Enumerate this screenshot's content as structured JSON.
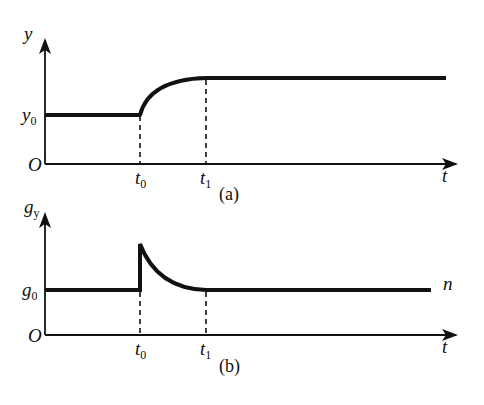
{
  "colors": {
    "background": "#ffffff",
    "ink": "#111111"
  },
  "panels": [
    {
      "id": "a",
      "caption": "(a)",
      "y_axis_label": "y",
      "x_axis_label": "t",
      "origin_label": "O",
      "level_label": "y",
      "level_sub": "0",
      "tick_t0": "t",
      "tick_t0_sub": "0",
      "tick_t1": "t",
      "tick_t1_sub": "1",
      "curve_description": "constant at y0 until t0, rises along a concave saturating curve, reaches higher plateau at t1 and stays constant"
    },
    {
      "id": "b",
      "caption": "(b)",
      "y_axis_label": "g",
      "y_axis_sub": "y",
      "x_axis_label": "t",
      "origin_label": "O",
      "level_label": "g",
      "level_sub": "0",
      "end_label": "n",
      "tick_t0": "t",
      "tick_t0_sub": "0",
      "tick_t1": "t",
      "tick_t1_sub": "1",
      "curve_description": "constant at g0 until t0, jumps up to a peak at t0, decays exponentially back to g0 by t1, then constant"
    }
  ]
}
